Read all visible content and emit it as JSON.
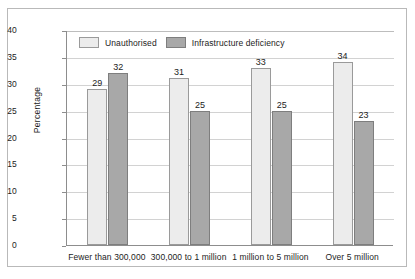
{
  "chart_data": {
    "type": "bar",
    "title": "",
    "xlabel": "",
    "ylabel": "Percentage",
    "ylim": [
      0,
      40
    ],
    "ytick_step": 5,
    "yticks": [
      "40",
      "35",
      "30",
      "25",
      "20",
      "15",
      "10",
      "5",
      "0"
    ],
    "grid": true,
    "legend_position": "top-left-inside",
    "categories": [
      "Fewer than 300,000",
      "300,000 to 1 million",
      "1 million to 5 million",
      "Over 5 million"
    ],
    "series": [
      {
        "name": "Unauthorised",
        "color": "#ececec",
        "border_color": "#9a9a9a",
        "values": [
          29,
          31,
          33,
          34
        ]
      },
      {
        "name": "Infrastructure deficiency",
        "color": "#a8a8a8",
        "border_color": "#7e7e7e",
        "values": [
          32,
          25,
          25,
          23
        ]
      }
    ],
    "value_labels": [
      [
        "29",
        "32"
      ],
      [
        "31",
        "25"
      ],
      [
        "33",
        "25"
      ],
      [
        "34",
        "23"
      ]
    ]
  },
  "legend": {
    "items": [
      {
        "label": "Unauthorised"
      },
      {
        "label": "Infrastructure deficiency"
      }
    ]
  }
}
